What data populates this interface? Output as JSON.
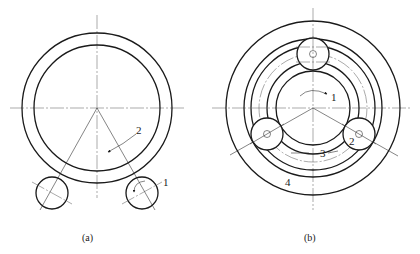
{
  "figure": {
    "colors": {
      "line": "#1a1a1a",
      "background": "#ffffff"
    },
    "panel_a": {
      "caption": "(a)",
      "labels": {
        "roller": "1",
        "workpiece_rotation": "2"
      },
      "description": "Ring workpiece supported on two rollers"
    },
    "panel_b": {
      "caption": "(b)",
      "labels": {
        "sun": "1",
        "planet": "2",
        "inner_ring": "3",
        "outer_ring": "4"
      },
      "description": "Planetary arrangement with three rollers between concentric rings"
    }
  }
}
